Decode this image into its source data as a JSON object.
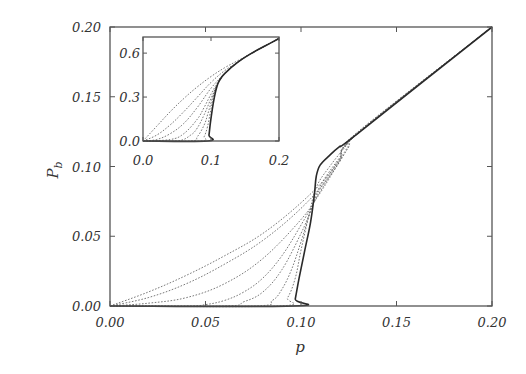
{
  "chart_data": [
    {
      "name": "main",
      "type": "line",
      "title": "",
      "xlabel": "p",
      "ylabel": "P_b",
      "xlim": [
        0.0,
        0.2
      ],
      "ylim": [
        0.0,
        0.2
      ],
      "xticks": [
        "0.00",
        "0.05",
        "0.10",
        "0.15",
        "0.20"
      ],
      "yticks": [
        "0.00",
        "0.05",
        "0.10",
        "0.15",
        "0.20"
      ],
      "grid": false,
      "legend": null,
      "series": [
        {
          "name": "L1",
          "style": "dotted",
          "points": [
            [
              0,
              0
            ],
            [
              0.02,
              0.01
            ],
            [
              0.04,
              0.022
            ],
            [
              0.06,
              0.036
            ],
            [
              0.08,
              0.052
            ],
            [
              0.1,
              0.074
            ],
            [
              0.115,
              0.095
            ],
            [
              0.125,
              0.115
            ],
            [
              0.13,
              0.125
            ],
            [
              0.2,
              0.2
            ]
          ]
        },
        {
          "name": "L2",
          "style": "dotted",
          "points": [
            [
              0,
              0
            ],
            [
              0.02,
              0.006
            ],
            [
              0.04,
              0.016
            ],
            [
              0.06,
              0.03
            ],
            [
              0.08,
              0.047
            ],
            [
              0.1,
              0.07
            ],
            [
              0.115,
              0.093
            ],
            [
              0.125,
              0.114
            ],
            [
              0.13,
              0.125
            ],
            [
              0.2,
              0.2
            ]
          ]
        },
        {
          "name": "L3",
          "style": "dotted",
          "points": [
            [
              0,
              0
            ],
            [
              0.02,
              0.002
            ],
            [
              0.04,
              0.006
            ],
            [
              0.06,
              0.016
            ],
            [
              0.08,
              0.034
            ],
            [
              0.1,
              0.062
            ],
            [
              0.11,
              0.081
            ],
            [
              0.12,
              0.103
            ],
            [
              0.13,
              0.124
            ],
            [
              0.2,
              0.2
            ]
          ]
        },
        {
          "name": "L4",
          "style": "dotted",
          "points": [
            [
              0,
              0
            ],
            [
              0.04,
              0.0
            ],
            [
              0.05,
              0.001
            ],
            [
              0.06,
              0.004
            ],
            [
              0.07,
              0.01
            ],
            [
              0.08,
              0.02
            ],
            [
              0.09,
              0.036
            ],
            [
              0.1,
              0.058
            ],
            [
              0.11,
              0.082
            ],
            [
              0.12,
              0.104
            ],
            [
              0.13,
              0.124
            ],
            [
              0.2,
              0.2
            ]
          ]
        },
        {
          "name": "L5",
          "style": "dotted",
          "points": [
            [
              0,
              0
            ],
            [
              0.06,
              0.0
            ],
            [
              0.07,
              0.003
            ],
            [
              0.08,
              0.01
            ],
            [
              0.09,
              0.026
            ],
            [
              0.1,
              0.052
            ],
            [
              0.105,
              0.068
            ],
            [
              0.11,
              0.084
            ],
            [
              0.12,
              0.105
            ],
            [
              0.13,
              0.124
            ],
            [
              0.2,
              0.2
            ]
          ]
        },
        {
          "name": "L6",
          "style": "dotted",
          "points": [
            [
              0,
              0
            ],
            [
              0.075,
              0.0
            ],
            [
              0.085,
              0.004
            ],
            [
              0.09,
              0.012
            ],
            [
              0.095,
              0.026
            ],
            [
              0.1,
              0.046
            ],
            [
              0.105,
              0.068
            ],
            [
              0.11,
              0.086
            ],
            [
              0.12,
              0.106
            ],
            [
              0.13,
              0.124
            ],
            [
              0.2,
              0.2
            ]
          ]
        },
        {
          "name": "L7",
          "style": "dotted",
          "points": [
            [
              0,
              0
            ],
            [
              0.088,
              0.0
            ],
            [
              0.093,
              0.006
            ],
            [
              0.097,
              0.02
            ],
            [
              0.1,
              0.04
            ],
            [
              0.104,
              0.064
            ],
            [
              0.108,
              0.085
            ],
            [
              0.115,
              0.1
            ],
            [
              0.125,
              0.117
            ],
            [
              0.13,
              0.124
            ],
            [
              0.2,
              0.2
            ]
          ]
        },
        {
          "name": "L8",
          "style": "solid",
          "points": [
            [
              0,
              0
            ],
            [
              0.096,
              0.0
            ],
            [
              0.097,
              0.005
            ],
            [
              0.099,
              0.02
            ],
            [
              0.102,
              0.04
            ],
            [
              0.105,
              0.06
            ],
            [
              0.107,
              0.08
            ],
            [
              0.108,
              0.093
            ],
            [
              0.11,
              0.101
            ],
            [
              0.115,
              0.108
            ],
            [
              0.12,
              0.114
            ],
            [
              0.13,
              0.124
            ],
            [
              0.2,
              0.2
            ]
          ]
        }
      ]
    },
    {
      "name": "inset",
      "type": "line",
      "title": "",
      "xlabel": "",
      "ylabel": "",
      "xlim": [
        0.0,
        0.2
      ],
      "ylim": [
        0.0,
        0.71
      ],
      "xticks": [
        "0.0",
        "0.1",
        "0.2"
      ],
      "yticks": [
        "0.0",
        "0.3",
        "0.6"
      ],
      "grid": false,
      "series": [
        {
          "name": "L1",
          "style": "dotted",
          "points": [
            [
              0,
              0
            ],
            [
              0.02,
              0.1
            ],
            [
              0.04,
              0.2
            ],
            [
              0.06,
              0.29
            ],
            [
              0.08,
              0.37
            ],
            [
              0.1,
              0.44
            ],
            [
              0.12,
              0.5
            ],
            [
              0.14,
              0.55
            ],
            [
              0.16,
              0.6
            ],
            [
              0.18,
              0.65
            ],
            [
              0.2,
              0.7
            ]
          ]
        },
        {
          "name": "L2",
          "style": "dotted",
          "points": [
            [
              0,
              0
            ],
            [
              0.02,
              0.04
            ],
            [
              0.04,
              0.11
            ],
            [
              0.06,
              0.2
            ],
            [
              0.08,
              0.3
            ],
            [
              0.1,
              0.4
            ],
            [
              0.12,
              0.48
            ],
            [
              0.14,
              0.54
            ],
            [
              0.16,
              0.6
            ],
            [
              0.18,
              0.65
            ],
            [
              0.2,
              0.7
            ]
          ]
        },
        {
          "name": "L3",
          "style": "dotted",
          "points": [
            [
              0,
              0
            ],
            [
              0.02,
              0.01
            ],
            [
              0.04,
              0.05
            ],
            [
              0.06,
              0.12
            ],
            [
              0.08,
              0.23
            ],
            [
              0.1,
              0.36
            ],
            [
              0.12,
              0.46
            ],
            [
              0.14,
              0.54
            ],
            [
              0.16,
              0.6
            ],
            [
              0.18,
              0.65
            ],
            [
              0.2,
              0.7
            ]
          ]
        },
        {
          "name": "L4",
          "style": "dotted",
          "points": [
            [
              0,
              0
            ],
            [
              0.04,
              0.01
            ],
            [
              0.06,
              0.05
            ],
            [
              0.08,
              0.15
            ],
            [
              0.09,
              0.23
            ],
            [
              0.1,
              0.32
            ],
            [
              0.11,
              0.4
            ],
            [
              0.12,
              0.46
            ],
            [
              0.14,
              0.54
            ],
            [
              0.16,
              0.6
            ],
            [
              0.18,
              0.65
            ],
            [
              0.2,
              0.7
            ]
          ]
        },
        {
          "name": "L5",
          "style": "dotted",
          "points": [
            [
              0,
              0
            ],
            [
              0.05,
              0.0
            ],
            [
              0.07,
              0.04
            ],
            [
              0.08,
              0.09
            ],
            [
              0.09,
              0.18
            ],
            [
              0.1,
              0.29
            ],
            [
              0.11,
              0.39
            ],
            [
              0.12,
              0.46
            ],
            [
              0.14,
              0.54
            ],
            [
              0.16,
              0.6
            ],
            [
              0.18,
              0.65
            ],
            [
              0.2,
              0.7
            ]
          ]
        },
        {
          "name": "L6",
          "style": "dotted",
          "points": [
            [
              0,
              0
            ],
            [
              0.07,
              0.0
            ],
            [
              0.08,
              0.03
            ],
            [
              0.09,
              0.11
            ],
            [
              0.095,
              0.18
            ],
            [
              0.1,
              0.26
            ],
            [
              0.105,
              0.34
            ],
            [
              0.11,
              0.39
            ],
            [
              0.12,
              0.46
            ],
            [
              0.14,
              0.54
            ],
            [
              0.16,
              0.6
            ],
            [
              0.18,
              0.65
            ],
            [
              0.2,
              0.7
            ]
          ]
        },
        {
          "name": "L7",
          "style": "dotted",
          "points": [
            [
              0,
              0
            ],
            [
              0.085,
              0.0
            ],
            [
              0.09,
              0.03
            ],
            [
              0.095,
              0.1
            ],
            [
              0.1,
              0.22
            ],
            [
              0.105,
              0.33
            ],
            [
              0.11,
              0.39
            ],
            [
              0.12,
              0.46
            ],
            [
              0.14,
              0.54
            ],
            [
              0.16,
              0.6
            ],
            [
              0.18,
              0.65
            ],
            [
              0.2,
              0.7
            ]
          ]
        },
        {
          "name": "L8",
          "style": "solid",
          "points": [
            [
              0,
              0
            ],
            [
              0.095,
              0.0
            ],
            [
              0.097,
              0.04
            ],
            [
              0.099,
              0.12
            ],
            [
              0.102,
              0.22
            ],
            [
              0.105,
              0.3
            ],
            [
              0.108,
              0.36
            ],
            [
              0.112,
              0.41
            ],
            [
              0.12,
              0.46
            ],
            [
              0.14,
              0.54
            ],
            [
              0.16,
              0.6
            ],
            [
              0.18,
              0.65
            ],
            [
              0.2,
              0.7
            ]
          ]
        }
      ]
    }
  ]
}
